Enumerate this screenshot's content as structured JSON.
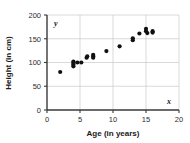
{
  "chart_data": {
    "type": "scatter",
    "title": "",
    "xlabel": "Age (in years)",
    "ylabel": "Height (in cm)",
    "x_axis_letter": "x",
    "y_axis_letter": "y",
    "xlim": [
      0,
      20
    ],
    "ylim": [
      0,
      200
    ],
    "xticks": [
      0,
      5,
      10,
      15,
      20
    ],
    "yticks": [
      0,
      50,
      100,
      150,
      200
    ],
    "xtick_labels": [
      "0",
      "5",
      "10",
      "15",
      "20"
    ],
    "ytick_labels": [
      "0",
      "50",
      "100",
      "150",
      "200"
    ],
    "grid": true,
    "legend": null,
    "marker_color": "#111111",
    "grid_color": "#c9c9c9",
    "axis_color": "#3a3a3a",
    "points": [
      {
        "x": 2.0,
        "y": 80
      },
      {
        "x": 4.0,
        "y": 92
      },
      {
        "x": 4.0,
        "y": 96
      },
      {
        "x": 4.0,
        "y": 99
      },
      {
        "x": 4.0,
        "y": 102
      },
      {
        "x": 4.6,
        "y": 100
      },
      {
        "x": 5.2,
        "y": 100
      },
      {
        "x": 6.0,
        "y": 110
      },
      {
        "x": 6.1,
        "y": 113
      },
      {
        "x": 7.0,
        "y": 110
      },
      {
        "x": 7.0,
        "y": 113
      },
      {
        "x": 7.0,
        "y": 116
      },
      {
        "x": 9.0,
        "y": 124
      },
      {
        "x": 11.0,
        "y": 134
      },
      {
        "x": 13.0,
        "y": 147
      },
      {
        "x": 13.0,
        "y": 151
      },
      {
        "x": 14.0,
        "y": 161
      },
      {
        "x": 15.0,
        "y": 166
      },
      {
        "x": 15.0,
        "y": 171
      },
      {
        "x": 15.2,
        "y": 162
      },
      {
        "x": 16.0,
        "y": 163
      },
      {
        "x": 16.0,
        "y": 166
      }
    ]
  },
  "axes": {
    "x_title": "Age (in years)",
    "y_title": "Height (in cm)",
    "x_letter": "x",
    "y_letter": "y"
  }
}
